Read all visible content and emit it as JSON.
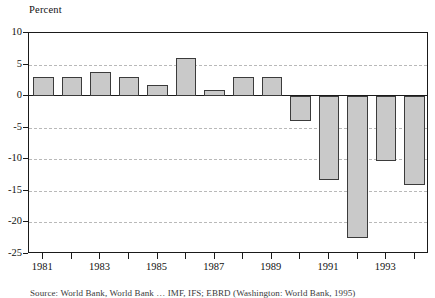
{
  "chart_data": {
    "type": "bar",
    "title": "",
    "ylabel": "Percent",
    "xlabel": "",
    "ylim": [
      -25,
      10
    ],
    "yticks": [
      10,
      5,
      0,
      -5,
      -10,
      -15,
      -20,
      -25
    ],
    "ytick_labels": [
      "10",
      "5",
      "0",
      "-5",
      "-10",
      "-15",
      "-20",
      "-25"
    ],
    "grid": true,
    "grid_axis": "y",
    "legend": "none",
    "categories": [
      "1981",
      "1982",
      "1983",
      "1984",
      "1985",
      "1986",
      "1987",
      "1988",
      "1989",
      "1990",
      "1991",
      "1992",
      "1993",
      "1994"
    ],
    "xtick_labels": [
      "1981",
      "1983",
      "1985",
      "1987",
      "1989",
      "1991",
      "1993"
    ],
    "values": [
      3.0,
      3.0,
      3.8,
      3.0,
      1.8,
      6.0,
      1.0,
      3.0,
      3.0,
      -4.0,
      -13.3,
      -22.5,
      -10.2,
      -14.0
    ],
    "bar_color": "#c9c9c9",
    "bar_edge_color": "#3b3b3b",
    "axis_color": "#1a1a1a",
    "grid_color": "#b9b9b9"
  },
  "axis": {
    "y_title": "Percent"
  },
  "source": {
    "note": "Source:  World Bank, World Bank … IMF, IFS; EBRD (Washington: World Bank, 1995)"
  }
}
